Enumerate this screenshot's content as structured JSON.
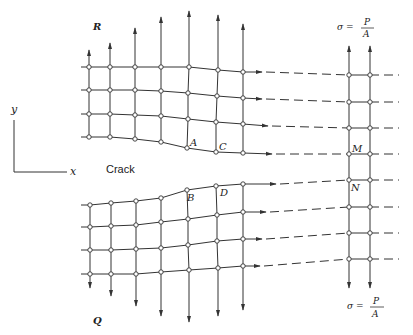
{
  "figure": {
    "labels": {
      "R": "R",
      "Q": "Q",
      "crack": "Crack",
      "axis_x": "x",
      "axis_y": "y",
      "A": "A",
      "B": "B",
      "C": "C",
      "D": "D",
      "M": "M",
      "N": "N",
      "sigma_top": {
        "lhs": "σ =",
        "num": "P",
        "den": "A"
      },
      "sigma_bottom": {
        "lhs": "σ =",
        "num": "P",
        "den": "A"
      }
    },
    "colors": {
      "line": "#333333",
      "node_fill": "#ffffff",
      "background": "#ffffff"
    },
    "upper_grid": {
      "columns": [
        {
          "x": 89,
          "arrow_tip": 50,
          "nodes": [
            [
              89,
              67
            ],
            [
              89,
              90
            ],
            [
              89,
              114
            ],
            [
              89,
              137
            ]
          ]
        },
        {
          "x": 110,
          "arrow_tip": 43,
          "nodes": [
            [
              110,
              67
            ],
            [
              110,
              90
            ],
            [
              110,
              114
            ],
            [
              110,
              137
            ]
          ]
        },
        {
          "x": 135,
          "arrow_tip": 28,
          "nodes": [
            [
              135,
              67
            ],
            [
              135,
              90
            ],
            [
              135,
              115
            ],
            [
              135,
              139
            ]
          ]
        },
        {
          "x": 161,
          "arrow_tip": 17,
          "nodes": [
            [
              161,
              67
            ],
            [
              161,
              91
            ],
            [
              161,
              116
            ],
            [
              161,
              142
            ]
          ]
        },
        {
          "x": 189,
          "arrow_tip": 11,
          "nodes": [
            [
              189,
              67
            ],
            [
              188,
              93
            ],
            [
              188,
              119
            ],
            [
              187,
              148
            ]
          ]
        },
        {
          "x": 218,
          "arrow_tip": 15,
          "nodes": [
            [
              218,
              70
            ],
            [
              217,
              96
            ],
            [
              216,
              122
            ],
            [
              216,
              152
            ]
          ]
        },
        {
          "x": 243,
          "arrow_tip": 24,
          "nodes": [
            [
              243,
              72
            ],
            [
              243,
              98
            ],
            [
              243,
              124
            ],
            [
              243,
              153
            ]
          ]
        }
      ],
      "row_start_x": 81,
      "rows_arrow_end": [
        [
          262,
          72
        ],
        [
          262,
          99
        ],
        [
          268,
          126
        ],
        [
          272,
          154
        ]
      ]
    },
    "lower_grid": {
      "columns": [
        {
          "x": 90,
          "arrow_tip": 288,
          "nodes": [
            [
              90,
              205
            ],
            [
              90,
              227
            ],
            [
              90,
              250
            ],
            [
              90,
              274
            ]
          ]
        },
        {
          "x": 111,
          "arrow_tip": 296,
          "nodes": [
            [
              111,
              203
            ],
            [
              111,
              226
            ],
            [
              111,
              250
            ],
            [
              111,
              274
            ]
          ]
        },
        {
          "x": 136,
          "arrow_tip": 306,
          "nodes": [
            [
              136,
              201
            ],
            [
              136,
              225
            ],
            [
              136,
              249
            ],
            [
              136,
              274
            ]
          ]
        },
        {
          "x": 161,
          "arrow_tip": 316,
          "nodes": [
            [
              161,
              198
            ],
            [
              161,
              222
            ],
            [
              161,
              248
            ],
            [
              161,
              272
            ]
          ]
        },
        {
          "x": 188,
          "arrow_tip": 322,
          "nodes": [
            [
              187,
              190
            ],
            [
              188,
              219
            ],
            [
              188,
              245
            ],
            [
              189,
              270
            ]
          ]
        },
        {
          "x": 217,
          "arrow_tip": 316,
          "nodes": [
            [
              216,
              186
            ],
            [
              217,
              215
            ],
            [
              217,
              241
            ],
            [
              218,
              268
            ]
          ]
        },
        {
          "x": 243,
          "arrow_tip": 310,
          "nodes": [
            [
              243,
              184
            ],
            [
              243,
              212
            ],
            [
              243,
              239
            ],
            [
              243,
              266
            ]
          ]
        }
      ],
      "row_start_x": 81,
      "rows_arrow_end": [
        [
          276,
          184
        ],
        [
          266,
          212
        ],
        [
          262,
          239
        ],
        [
          260,
          266
        ]
      ]
    },
    "far_grid": {
      "columns": [
        {
          "x": 349,
          "arrow_top": 46,
          "arrow_bottom": 288
        },
        {
          "x": 370,
          "arrow_top": 46,
          "arrow_bottom": 288
        }
      ],
      "rows_y": [
        75,
        102,
        128,
        154,
        180,
        207,
        233,
        259
      ],
      "dash_end_x": 399
    },
    "label_positions": {
      "R": [
        93,
        30
      ],
      "Q": [
        93,
        322
      ],
      "crack": [
        106,
        173
      ],
      "axis_y": [
        11,
        113
      ],
      "axis_x": [
        70,
        175
      ],
      "A": [
        190,
        146
      ],
      "B": [
        187,
        200
      ],
      "C": [
        219,
        150
      ],
      "D": [
        220,
        196
      ],
      "M": [
        352,
        152
      ],
      "N": [
        351,
        190
      ]
    }
  }
}
